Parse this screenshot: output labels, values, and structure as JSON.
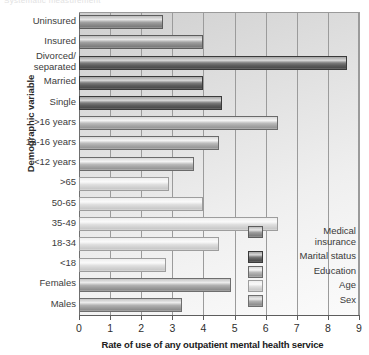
{
  "caption_remnant": "Systematic measurement",
  "chart_data": {
    "type": "bar",
    "orientation": "horizontal",
    "title": "",
    "xlabel": "Rate of use of any outpatient mental health service",
    "ylabel": "Demographic variable",
    "xlim": [
      0,
      9
    ],
    "xticks": [
      "0",
      "1",
      "2",
      "3",
      "4",
      "5",
      "6",
      "7",
      "8",
      "9"
    ],
    "grid": true,
    "grid_axis": "x",
    "legend_position": "inside-right",
    "categories": [
      "Uninsured",
      "Insured",
      "Divorced/\nseparated",
      "Married",
      "Single",
      ">16 years",
      "12-16 years",
      "<12 years",
      ">65",
      "50-65",
      "35-49",
      "18-34",
      "<18",
      "Females",
      "Males"
    ],
    "bars": [
      {
        "label": "Uninsured",
        "label_lines": [
          "Uninsured"
        ],
        "value": 2.7,
        "group": "Medical insurance",
        "group_key": "insurance"
      },
      {
        "label": "Insured",
        "label_lines": [
          "Insured"
        ],
        "value": 4.0,
        "group": "Medical insurance",
        "group_key": "insurance"
      },
      {
        "label": "Divorced/separated",
        "label_lines": [
          "Divorced/",
          "separated"
        ],
        "value": 8.6,
        "group": "Marital status",
        "group_key": "marital"
      },
      {
        "label": "Married",
        "label_lines": [
          "Married"
        ],
        "value": 4.0,
        "group": "Marital status",
        "group_key": "marital"
      },
      {
        "label": "Single",
        "label_lines": [
          "Single"
        ],
        "value": 4.6,
        "group": "Marital status",
        "group_key": "marital"
      },
      {
        "label": ">16 years",
        "label_lines": [
          ">16 years"
        ],
        "value": 6.4,
        "group": "Education",
        "group_key": "education"
      },
      {
        "label": "12-16 years",
        "label_lines": [
          "12-16 years"
        ],
        "value": 4.5,
        "group": "Education",
        "group_key": "education"
      },
      {
        "label": "<12 years",
        "label_lines": [
          "<12 years"
        ],
        "value": 3.7,
        "group": "Education",
        "group_key": "education"
      },
      {
        "label": ">65",
        "label_lines": [
          ">65"
        ],
        "value": 2.9,
        "group": "Age",
        "group_key": "age"
      },
      {
        "label": "50-65",
        "label_lines": [
          "50-65"
        ],
        "value": 4.0,
        "group": "Age",
        "group_key": "age"
      },
      {
        "label": "35-49",
        "label_lines": [
          "35-49"
        ],
        "value": 6.4,
        "group": "Age",
        "group_key": "age"
      },
      {
        "label": "18-34",
        "label_lines": [
          "18-34"
        ],
        "value": 4.5,
        "group": "Age",
        "group_key": "age"
      },
      {
        "label": "<18",
        "label_lines": [
          "<18"
        ],
        "value": 2.8,
        "group": "Age",
        "group_key": "age"
      },
      {
        "label": "Females",
        "label_lines": [
          "Females"
        ],
        "value": 4.9,
        "group": "Sex",
        "group_key": "sex"
      },
      {
        "label": "Males",
        "label_lines": [
          "Males"
        ],
        "value": 3.3,
        "group": "Sex",
        "group_key": "sex"
      }
    ],
    "legend": [
      {
        "label": "Medical insurance",
        "label_lines": [
          "Medical",
          "insurance"
        ],
        "group_key": "insurance",
        "color": "#9a9a9a"
      },
      {
        "label": "Marital status",
        "label_lines": [
          "Marital status"
        ],
        "group_key": "marital",
        "color": "#5e5e5e"
      },
      {
        "label": "Education",
        "label_lines": [
          "Education"
        ],
        "group_key": "education",
        "color": "#a8a8a8"
      },
      {
        "label": "Age",
        "label_lines": [
          "Age"
        ],
        "group_key": "age",
        "color": "#dcdcdc"
      },
      {
        "label": "Sex",
        "label_lines": [
          "Sex"
        ],
        "group_key": "sex",
        "color": "#b0b0b0"
      }
    ]
  }
}
